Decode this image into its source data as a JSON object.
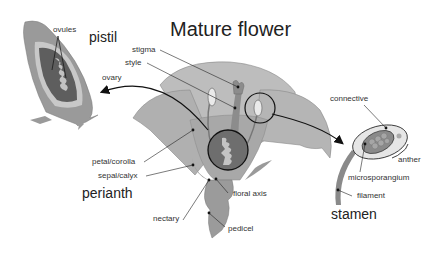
{
  "title": "Mature flower",
  "sections": {
    "pistil": "pistil",
    "perianth": "perianth",
    "stamen": "stamen"
  },
  "labels": {
    "ovules": "ovules",
    "ovary": "ovary",
    "stigma": "stigma",
    "style": "style",
    "petal_corolla": "petal/corolla",
    "sepal_calyx": "sepal/calyx",
    "nectary": "nectary",
    "floral_axis": "floral axis",
    "pedicel": "pedicel",
    "connective": "connective",
    "anther": "anther",
    "microsporangium": "microsporangium",
    "filament": "filament"
  },
  "colors": {
    "light_gray": "#b8b8b8",
    "mid_gray": "#8f8f8f",
    "dark_gray": "#5a5a5a",
    "pale": "#d9d9d9",
    "line": "#222222"
  }
}
